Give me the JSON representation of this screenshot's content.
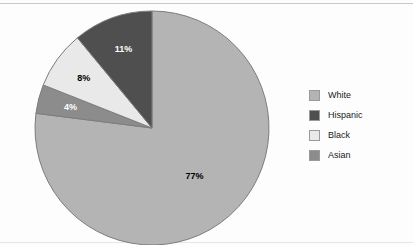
{
  "chart_data": {
    "type": "pie",
    "title": "",
    "categories": [
      "White",
      "Hispanic",
      "Black",
      "Asian"
    ],
    "values": [
      77,
      11,
      8,
      4
    ],
    "value_labels": [
      "77%",
      "11%",
      "8%",
      "4%"
    ],
    "colors": [
      "#b4b4b4",
      "#4f4f4f",
      "#e9e9e9",
      "#8c8c8c"
    ],
    "label_text_colors": [
      "#000000",
      "#ffffff",
      "#000000",
      "#ffffff"
    ],
    "legend_position": "right",
    "grid": false,
    "slice_order": "clockwise-from-top",
    "units": "percent"
  },
  "chart": {
    "slices": [
      {
        "name": "White",
        "label": "77%",
        "percent": 77,
        "color": "#b4b4b4",
        "label_color": "#000000"
      },
      {
        "name": "Asian",
        "label": "4%",
        "percent": 4,
        "color": "#8c8c8c",
        "label_color": "#ffffff"
      },
      {
        "name": "Black",
        "label": "8%",
        "percent": 8,
        "color": "#e9e9e9",
        "label_color": "#000000"
      },
      {
        "name": "Hispanic",
        "label": "11%",
        "percent": 11,
        "color": "#4f4f4f",
        "label_color": "#ffffff"
      }
    ]
  },
  "legend": {
    "items": [
      {
        "label": "White",
        "color": "#b4b4b4"
      },
      {
        "label": "Hispanic",
        "color": "#4f4f4f"
      },
      {
        "label": "Black",
        "color": "#e9e9e9"
      },
      {
        "label": "Asian",
        "color": "#8c8c8c"
      }
    ]
  }
}
